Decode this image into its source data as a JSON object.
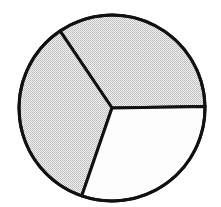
{
  "figure": {
    "title": "",
    "background_color": "#ffffff",
    "width": 221,
    "height": 207
  },
  "chart_data": {
    "type": "pie",
    "title": "",
    "subtitle": "",
    "xlabel": "",
    "ylabel": "",
    "grid": false,
    "legend_position": "none",
    "center": {
      "x": 112,
      "y": 108
    },
    "radius": 93,
    "stroke_color": "#111111",
    "stroke_width": 3,
    "total_degrees": 360,
    "start_angle_deg": 1,
    "direction": "counterclockwise",
    "labels": [
      "Sector 1",
      "Sector 2",
      "Sector 3"
    ],
    "values": [
      123,
      127,
      110
    ],
    "percentages": [
      34.2,
      35.3,
      30.5
    ],
    "colors": [
      "#d8d8d8",
      "#d8d8d8",
      "#ffffff"
    ],
    "slices": [
      {
        "name": "top-right-slice",
        "label": "Sector 1",
        "value": 123,
        "percent": 34.2,
        "start_angle_deg": 1,
        "end_angle_deg": 124,
        "fill": "#d8d8d8",
        "fill_style": "halftone-gray",
        "edge_point": {
          "x": 203,
          "y": 106
        }
      },
      {
        "name": "left-slice",
        "label": "Sector 2",
        "value": 127,
        "percent": 35.3,
        "start_angle_deg": 124,
        "end_angle_deg": 251,
        "fill": "#d8d8d8",
        "fill_style": "halftone-gray",
        "edge_point": {
          "x": 60,
          "y": 30
        }
      },
      {
        "name": "bottom-right-slice",
        "label": "Sector 3",
        "value": 110,
        "percent": 30.5,
        "start_angle_deg": 251,
        "end_angle_deg": 361,
        "fill": "#ffffff",
        "fill_style": "solid-white",
        "edge_point": {
          "x": 80,
          "y": 200
        }
      }
    ]
  }
}
